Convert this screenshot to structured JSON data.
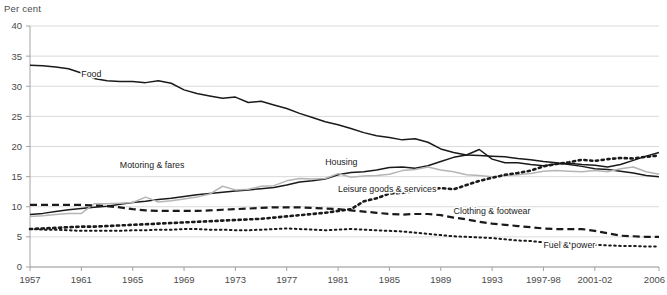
{
  "axis_unit_label": "Per cent",
  "chart_data": {
    "type": "line",
    "title": "",
    "subtitle": "",
    "xlabel": "",
    "ylabel": "Per cent",
    "ylim": [
      0,
      40
    ],
    "xlim": [
      1957,
      2006
    ],
    "grid": true,
    "legend_position": "inline-annotations",
    "ytick_labels": [
      "0",
      "5",
      "10",
      "15",
      "20",
      "25",
      "30",
      "35",
      "40"
    ],
    "ytick_values": [
      0,
      5,
      10,
      15,
      20,
      25,
      30,
      35,
      40
    ],
    "xtick_labels": [
      "1957",
      "1961",
      "1965",
      "1969",
      "1973",
      "1977",
      "1981",
      "1985",
      "1989",
      "1993",
      "1997-98",
      "2001-02",
      "2006"
    ],
    "xtick_values": [
      1957,
      1961,
      1965,
      1969,
      1973,
      1977,
      1981,
      1985,
      1989,
      1993,
      1997,
      2001,
      2006
    ],
    "x": [
      1957,
      1958,
      1959,
      1960,
      1961,
      1962,
      1963,
      1964,
      1965,
      1966,
      1967,
      1968,
      1969,
      1970,
      1971,
      1972,
      1973,
      1974,
      1975,
      1976,
      1977,
      1978,
      1979,
      1980,
      1981,
      1982,
      1983,
      1984,
      1985,
      1986,
      1987,
      1988,
      1989,
      1990,
      1991,
      1992,
      1993,
      1994,
      1995,
      1996,
      1997,
      1998,
      1999,
      2000,
      2001,
      2002,
      2003,
      2004,
      2005,
      2006
    ],
    "series": [
      {
        "name": "Food",
        "style": "solid",
        "color": "#1a1a1a",
        "label_x": 1961,
        "label_y": 31.6,
        "values": [
          33.5,
          33.4,
          33.2,
          32.9,
          32.2,
          31.3,
          30.9,
          30.8,
          30.8,
          30.6,
          30.9,
          30.5,
          29.4,
          28.8,
          28.4,
          28.0,
          28.2,
          27.3,
          27.5,
          26.9,
          26.3,
          25.5,
          24.8,
          24.1,
          23.6,
          23.0,
          22.3,
          21.8,
          21.5,
          21.1,
          21.3,
          20.7,
          19.6,
          19.0,
          18.6,
          18.5,
          18.4,
          18.3,
          18.0,
          17.8,
          17.5,
          17.3,
          17.0,
          16.7,
          16.3,
          16.2,
          15.9,
          15.6,
          15.2,
          15.0
        ]
      },
      {
        "name": "Housing",
        "style": "solid",
        "color": "#1a1a1a",
        "label_x": 1980,
        "label_y": 16.9,
        "values": [
          8.7,
          8.9,
          9.2,
          9.5,
          9.7,
          9.9,
          10.1,
          10.4,
          10.7,
          10.9,
          11.2,
          11.4,
          11.7,
          12.0,
          12.2,
          12.4,
          12.6,
          12.8,
          13.0,
          13.2,
          13.6,
          14.1,
          14.3,
          14.6,
          15.3,
          15.7,
          15.8,
          16.1,
          16.5,
          16.6,
          16.4,
          16.8,
          17.5,
          18.2,
          18.6,
          19.5,
          17.9,
          17.3,
          17.3,
          17.0,
          16.8,
          17.1,
          17.2,
          17.0,
          16.9,
          16.6,
          17.0,
          17.7,
          18.4,
          19.0
        ]
      },
      {
        "name": "Motoring & fares",
        "style": "solid",
        "color": "#b5b5b5",
        "label_x": 1964,
        "label_y": 16.4,
        "values": [
          8.4,
          8.5,
          8.7,
          8.9,
          8.9,
          10.5,
          10.5,
          10.6,
          10.7,
          11.6,
          10.8,
          11.0,
          11.3,
          11.6,
          12.1,
          13.4,
          12.8,
          12.9,
          13.4,
          13.5,
          14.3,
          14.7,
          14.6,
          14.7,
          15.5,
          14.9,
          15.1,
          15.2,
          15.4,
          16.0,
          16.2,
          16.6,
          16.1,
          15.8,
          15.3,
          15.2,
          15.0,
          15.2,
          15.3,
          15.5,
          15.9,
          16.0,
          15.9,
          15.8,
          16.0,
          15.8,
          16.3,
          16.6,
          15.8,
          15.4
        ]
      },
      {
        "name": "Leisure goods & services",
        "style": "dotted-bold",
        "color": "#1a1a1a",
        "label_x": 1981,
        "label_y": 12.4,
        "values": [
          6.3,
          6.4,
          6.5,
          6.6,
          6.7,
          6.7,
          6.8,
          6.9,
          7.0,
          7.1,
          7.2,
          7.3,
          7.4,
          7.5,
          7.6,
          7.7,
          7.8,
          7.9,
          8.0,
          8.2,
          8.4,
          8.6,
          8.8,
          9.0,
          9.3,
          9.6,
          10.9,
          11.4,
          12.2,
          12.3,
          12.6,
          12.8,
          13.1,
          12.9,
          13.6,
          14.3,
          14.8,
          15.3,
          15.6,
          16.0,
          16.7,
          17.1,
          17.4,
          17.8,
          17.6,
          17.9,
          18.1,
          18.0,
          18.3,
          18.5
        ]
      },
      {
        "name": "Clothing & footwear",
        "style": "dashed",
        "color": "#1a1a1a",
        "label_x": 1990,
        "label_y": 8.8,
        "values": [
          10.3,
          10.3,
          10.3,
          10.3,
          10.3,
          10.2,
          10.1,
          9.9,
          9.6,
          9.4,
          9.3,
          9.3,
          9.3,
          9.3,
          9.4,
          9.5,
          9.6,
          9.7,
          9.8,
          9.9,
          9.9,
          9.9,
          9.8,
          9.7,
          9.6,
          9.4,
          9.2,
          9.0,
          8.8,
          8.7,
          8.8,
          8.8,
          8.6,
          8.2,
          7.9,
          7.5,
          7.2,
          7.0,
          6.8,
          6.6,
          6.4,
          6.3,
          6.3,
          6.3,
          6.0,
          5.6,
          5.2,
          5.1,
          5.0,
          5.0
        ]
      },
      {
        "name": "Fuel & power",
        "style": "dotted-fine",
        "color": "#1a1a1a",
        "label_x": 1997,
        "label_y": 3.1,
        "values": [
          6.3,
          6.2,
          6.2,
          6.1,
          6.0,
          6.0,
          6.0,
          6.0,
          6.1,
          6.1,
          6.2,
          6.2,
          6.3,
          6.3,
          6.2,
          6.2,
          6.1,
          6.1,
          6.2,
          6.3,
          6.4,
          6.3,
          6.2,
          6.1,
          6.2,
          6.3,
          6.2,
          6.1,
          6.0,
          5.9,
          5.7,
          5.5,
          5.3,
          5.1,
          5.0,
          4.9,
          4.8,
          4.6,
          4.4,
          4.3,
          4.1,
          4.0,
          3.9,
          3.8,
          3.7,
          3.6,
          3.5,
          3.5,
          3.4,
          3.4
        ]
      }
    ]
  }
}
